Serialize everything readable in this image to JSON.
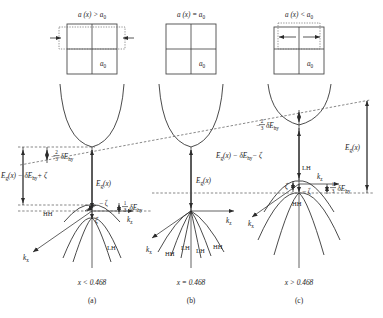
{
  "figure": {
    "type": "band-structure-diagram",
    "panel_count": 3
  },
  "colors": {
    "ink": "#1a1a1a",
    "curve": "#2b2b2b",
    "dashed": "#555555",
    "box": "#4a4a4a",
    "background": "#ffffff"
  },
  "panels": [
    {
      "id": "a",
      "caption": "(a)",
      "condition": "x < 0.468",
      "lattice_title": "a (x) > a",
      "lattice_title_sub": "0",
      "lattice_label": "a",
      "lattice_label_sub": "0",
      "strain": "compressive-in-plane",
      "arrows": "inward",
      "labels": {
        "top_gap": "−",
        "top_gap_frac_num": "2",
        "top_gap_frac_den": "3",
        "top_gap_tail": "δE",
        "top_gap_tail_sub": "hy",
        "left_gap": "E",
        "left_gap_sub": "g",
        "left_gap_rest": "(x) − δE",
        "left_gap_rest_sub": "hy",
        "left_gap_tail": "+ ζ",
        "mid_gap": "E",
        "mid_gap_sub": "g",
        "mid_gap_rest": "(x)",
        "minus_zeta": "− ζ",
        "zeta": "ζ",
        "third_frac_num": "1",
        "third_frac_den": "3",
        "third_tail": "δE",
        "third_tail_sub": "hy",
        "hh": "HH",
        "lh": "LH",
        "kz": "k",
        "kz_sub": "z",
        "kx": "k",
        "kx_sub": "x"
      }
    },
    {
      "id": "b",
      "caption": "(b)",
      "condition": "x = 0.468",
      "lattice_title": "a (x) = a",
      "lattice_title_sub": "0",
      "lattice_label": "a",
      "lattice_label_sub": "0",
      "strain": "unstrained",
      "arrows": "none",
      "labels": {
        "mid_gap": "E",
        "mid_gap_sub": "g",
        "mid_gap_rest": "(x)",
        "hh_left": "HH",
        "lh_left": "LH",
        "lh_right": "LH",
        "hh_right": "HH",
        "kz": "k",
        "kz_sub": "z",
        "kx": "k",
        "kx_sub": "x"
      }
    },
    {
      "id": "c",
      "caption": "(c)",
      "condition": "x > 0.468",
      "lattice_title": "a (x) < a",
      "lattice_title_sub": "0",
      "lattice_label": "a",
      "lattice_label_sub": "0",
      "strain": "tensile-in-plane",
      "arrows": "outward",
      "labels": {
        "top_gap": "−",
        "top_gap_frac_num": "2",
        "top_gap_frac_den": "3",
        "top_gap_tail": "δE",
        "top_gap_tail_sub": "hy",
        "mid_gap": "E",
        "mid_gap_sub": "g",
        "mid_gap_rest": "(x) − δE",
        "mid_gap_rest_sub": "hy",
        "mid_gap_tail": "− ζ",
        "right_gap": "E",
        "right_gap_sub": "g",
        "right_gap_rest": "(x)",
        "zeta": "ζ",
        "minus_zeta": "− ζ",
        "third_frac_num": "1",
        "third_frac_den": "3",
        "third_tail": "δE",
        "third_tail_sub": "hy",
        "hh": "HH",
        "lh": "LH",
        "kz": "k",
        "kz_sub": "z",
        "kx": "k",
        "kx_sub": "x"
      }
    }
  ]
}
